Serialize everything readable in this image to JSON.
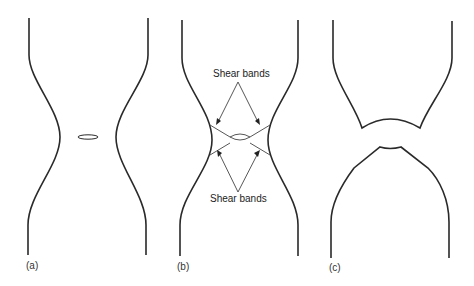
{
  "figure": {
    "panels": [
      {
        "id": "a",
        "label": "(a)",
        "description": "Necking with internal void forming at center"
      },
      {
        "id": "b",
        "label": "(b)",
        "description": "Void growth with shear bands forming at 45 degrees"
      },
      {
        "id": "c",
        "label": "(c)",
        "description": "Cup-and-cone fracture separation"
      }
    ],
    "annotations": {
      "top": "Shear bands",
      "bottom": "Shear bands"
    },
    "colors": {
      "line": "#2a2a2a",
      "background": "#ffffff"
    }
  }
}
